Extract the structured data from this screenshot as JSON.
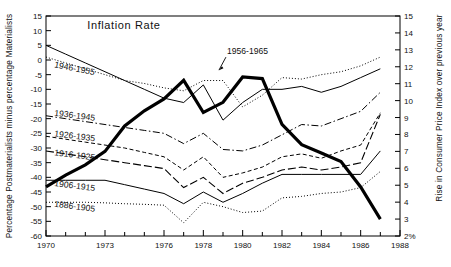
{
  "chart_data": {
    "type": "line",
    "title": "Inflation Rate",
    "xlabel": "",
    "ylabel": "Percentage Postmaterialists minus percentage Materialists",
    "y2label": "Rise in Consumer Price Index over previous year",
    "xlim": [
      1970,
      1988
    ],
    "ylim": [
      -60,
      15
    ],
    "y2lim": [
      15,
      2
    ],
    "grid": false,
    "legend_position": "inline-labels",
    "x_ticks": [
      1970,
      1971,
      1972,
      1973,
      1974,
      1975,
      1976,
      1977,
      1978,
      1979,
      1980,
      1981,
      1982,
      1983,
      1984,
      1985,
      1986,
      1987,
      1988
    ],
    "x_tick_labels": [
      "1970",
      "",
      "",
      "1973",
      "",
      "",
      "1976",
      "",
      "1978",
      "",
      "1980",
      "",
      "1982",
      "",
      "1984",
      "",
      "1986",
      "",
      "1988"
    ],
    "y_ticks": [
      15,
      10,
      5,
      0,
      -5,
      -10,
      -15,
      -20,
      -25,
      -30,
      -35,
      -40,
      -45,
      -50,
      -55,
      -60
    ],
    "y_tick_labels": [
      "15",
      "10",
      "5",
      "0",
      "-5",
      "-10",
      "-15",
      "-20",
      "-25",
      "-30",
      "-35",
      "-40",
      "-45",
      "-50",
      "-55",
      "-60"
    ],
    "y2_ticks": [
      2,
      3,
      4,
      5,
      6,
      7,
      8,
      9,
      10,
      11,
      12,
      13,
      14,
      15
    ],
    "y2_tick_labels": [
      "2%",
      "3",
      "4",
      "5",
      "6",
      "7",
      "8",
      "9",
      "10",
      "11",
      "12",
      "13",
      "14",
      "15"
    ],
    "x": [
      1970,
      1971,
      1972,
      1973,
      1974,
      1975,
      1976,
      1977,
      1978,
      1979,
      1980,
      1981,
      1982,
      1983,
      1984,
      1985,
      1986,
      1987
    ],
    "series": [
      {
        "name": "Inflation Rate",
        "style": "thick-solid",
        "axis": "right",
        "color": "#000000",
        "values_right_axis": [
          4.9,
          5.6,
          6.2,
          7.0,
          8.5,
          9.4,
          10.1,
          11.2,
          9.3,
          9.9,
          11.4,
          11.3,
          8.6,
          7.4,
          6.9,
          6.4,
          4.9,
          3.0
        ]
      },
      {
        "name": "1956-1965",
        "style": "dotted",
        "axis": "left",
        "color": "#000000",
        "values": [
          1.0,
          -1.0,
          -3.0,
          -5.0,
          -7.0,
          -8.0,
          -9.5,
          -10.5,
          -7.0,
          -7.0,
          -16.0,
          -12.0,
          -6.0,
          -6.5,
          -5.0,
          -4.0,
          -2.0,
          1.0
        ]
      },
      {
        "name": "1946-1955",
        "style": "thin-solid",
        "axis": "left",
        "color": "#000000",
        "values": [
          5.0,
          2.0,
          -1.0,
          -4.0,
          -7.0,
          -10.0,
          -13.0,
          -14.5,
          -8.5,
          -20.5,
          -14.5,
          -10.0,
          -10.0,
          -9.0,
          -11.0,
          -9.0,
          -6.0,
          -3.0
        ]
      },
      {
        "name": "1936-1945",
        "style": "dash-dot",
        "axis": "left",
        "color": "#000000",
        "values": [
          -19.0,
          -20.0,
          -21.0,
          -22.0,
          -23.0,
          -24.0,
          -25.0,
          -28.5,
          -25.0,
          -30.5,
          -31.0,
          -29.0,
          -25.5,
          -22.0,
          -22.5,
          -20.0,
          -17.5,
          -11.0
        ]
      },
      {
        "name": "1926-1935",
        "style": "short-dash",
        "axis": "left",
        "color": "#000000",
        "values": [
          -26.0,
          -27.0,
          -28.0,
          -29.0,
          -30.0,
          -31.5,
          -33.0,
          -37.5,
          -33.0,
          -40.0,
          -38.5,
          -36.5,
          -33.0,
          -32.0,
          -33.5,
          -31.0,
          -29.0,
          -18.0
        ]
      },
      {
        "name": "1916-1925",
        "style": "long-dash",
        "axis": "left",
        "color": "#000000",
        "values": [
          -31.0,
          -32.0,
          -33.0,
          -34.0,
          -35.0,
          -36.0,
          -37.0,
          -43.5,
          -40.0,
          -45.5,
          -42.0,
          -40.0,
          -37.5,
          -36.5,
          -37.5,
          -36.5,
          -35.0,
          -18.5
        ]
      },
      {
        "name": "1906-1915",
        "style": "thin-solid",
        "axis": "left",
        "color": "#000000",
        "values": [
          -41.0,
          -41.0,
          -41.0,
          -41.0,
          -42.5,
          -44.0,
          -45.5,
          -49.0,
          -45.0,
          -48.5,
          -45.5,
          -42.0,
          -39.0,
          -39.0,
          -39.0,
          -39.0,
          -39.0,
          -31.0
        ]
      },
      {
        "name": "1886-1905",
        "style": "dotted",
        "axis": "left",
        "color": "#000000",
        "values": [
          -48.5,
          -48.5,
          -48.5,
          -48.7,
          -49.0,
          -49.2,
          -49.5,
          -55.5,
          -48.5,
          -50.0,
          -52.0,
          -51.5,
          -47.0,
          -46.5,
          -45.5,
          -45.0,
          -43.5,
          -38.0
        ]
      }
    ],
    "annotations": [
      {
        "text": "Inflation Rate",
        "x": 1972.1,
        "y": 10.5,
        "kind": "title-label"
      },
      {
        "text": "1956-1965",
        "x": 1979.2,
        "y": 2.0,
        "kind": "series-label",
        "leader": true
      },
      {
        "text": "1946-1955",
        "x": 1970.4,
        "y": -2.5,
        "kind": "series-label",
        "rotated": true
      },
      {
        "text": "1936-1945",
        "x": 1970.4,
        "y": -19.0,
        "kind": "series-label"
      },
      {
        "text": "1926-1935",
        "x": 1970.4,
        "y": -26.0,
        "kind": "series-label"
      },
      {
        "text": "1916-1925",
        "x": 1970.4,
        "y": -32.5,
        "kind": "series-label"
      },
      {
        "text": "1906-1915",
        "x": 1970.4,
        "y": -43.0,
        "kind": "series-label"
      },
      {
        "text": "1886-1905",
        "x": 1970.4,
        "y": -50.0,
        "kind": "series-label"
      }
    ]
  }
}
